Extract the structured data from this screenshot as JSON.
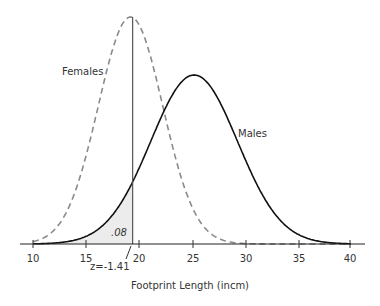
{
  "chart_data": {
    "type": "line",
    "title": "",
    "xlabel": "Footprint Length (incm)",
    "ylabel": "",
    "xlim": [
      10,
      40
    ],
    "xticks": [
      10,
      15,
      20,
      25,
      30,
      35,
      40
    ],
    "grid": false,
    "series": [
      {
        "name": "Females",
        "distribution": "normal",
        "mean": 19.2,
        "sd": 3.05,
        "style": "dashed",
        "color": "#888888"
      },
      {
        "name": "Males",
        "distribution": "normal",
        "mean": 25.2,
        "sd": 4.1,
        "style": "solid",
        "color": "#111111"
      }
    ],
    "annotations": [
      {
        "text": ".08",
        "type": "shaded-area",
        "description": "Area under male curve left of cutoff",
        "x_to": 19.4
      },
      {
        "text": "z=-1.41",
        "type": "arrow-label",
        "x": 19.4
      },
      {
        "type": "vertical-line",
        "x": 19.4
      }
    ],
    "legend_position": "inline-labels"
  },
  "labels": {
    "females": "Females",
    "males": "Males",
    "area": ".08",
    "z": "z=-1.41",
    "xlabel": "Footprint Length (incm)",
    "ticks": [
      "10",
      "15",
      "20",
      "25",
      "30",
      "35",
      "40"
    ]
  }
}
